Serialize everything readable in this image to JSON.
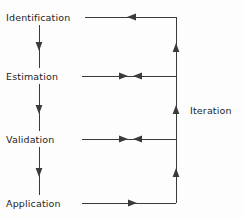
{
  "diagram": {
    "type": "flow-diagram",
    "background_color": "#fdfdfd",
    "line_color": "#3a3a3a",
    "text_color": "#1e1e1e",
    "stages": [
      {
        "id": "identification",
        "label": "Identification",
        "y": 17
      },
      {
        "id": "estimation",
        "label": "Estimation",
        "y": 76
      },
      {
        "id": "validation",
        "label": "Validation",
        "y": 139
      },
      {
        "id": "application",
        "label": "Application",
        "y": 203
      }
    ],
    "side_label": {
      "id": "iteration",
      "label": "Iteration",
      "y": 110
    },
    "stage_count": 4,
    "down_arrows": [
      {
        "from": "identification",
        "to": "estimation"
      },
      {
        "from": "estimation",
        "to": "validation"
      },
      {
        "from": "validation",
        "to": "application"
      }
    ],
    "feedback_arrows": [
      {
        "stage": "identification",
        "direction": "left",
        "note": "feedback into Identification"
      },
      {
        "stage": "estimation",
        "direction": "both",
        "note": "bidirectional at Estimation"
      },
      {
        "stage": "validation",
        "direction": "both",
        "note": "bidirectional at Validation"
      },
      {
        "stage": "application",
        "direction": "right",
        "note": "output from Application"
      }
    ]
  }
}
